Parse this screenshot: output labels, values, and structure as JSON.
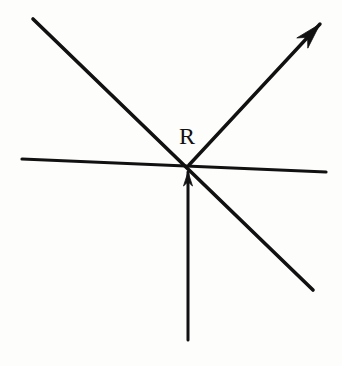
{
  "figure": {
    "canvas": {
      "width": 342,
      "height": 366
    },
    "background_color": "#fdfdfc",
    "ink_color": "#111111",
    "intersection": {
      "name": "R",
      "x": 189,
      "y": 165
    },
    "labels": [
      {
        "id": "point-r",
        "text": "R",
        "x": 179,
        "y": 124,
        "font_size": 24
      }
    ],
    "elements": [
      {
        "id": "horizontal-line",
        "kind": "line",
        "name": "horizontal-line",
        "x1": 22,
        "y1": 159,
        "x2": 326,
        "y2": 172,
        "stroke_width": 3.2,
        "arrow": "none"
      },
      {
        "id": "diagonal-line",
        "kind": "line",
        "name": "diagonal-line-nw-se",
        "x1": 33,
        "y1": 19,
        "x2": 313,
        "y2": 290,
        "stroke_width": 3.6,
        "arrow": "none"
      },
      {
        "id": "resultant-ray",
        "kind": "ray",
        "name": "resultant-ray-northeast",
        "x1": 189,
        "y1": 165,
        "x2": 320,
        "y2": 24,
        "stroke_width": 3.4,
        "arrow": "end"
      },
      {
        "id": "vertical-ray",
        "kind": "ray",
        "name": "vertical-ray-up",
        "x1": 188,
        "y1": 340,
        "x2": 188,
        "y2": 172,
        "stroke_width": 3.0,
        "arrow": "end"
      }
    ],
    "arrowheads": [
      {
        "id": "resultant-arrowhead",
        "name": "arrowhead-northeast",
        "tip_x": 320,
        "tip_y": 24,
        "length": 26,
        "half_width": 7.5
      },
      {
        "id": "vertical-arrowhead",
        "name": "arrowhead-up",
        "tip_x": 188,
        "tip_y": 172,
        "length": 14,
        "half_width": 4.5
      }
    ]
  }
}
